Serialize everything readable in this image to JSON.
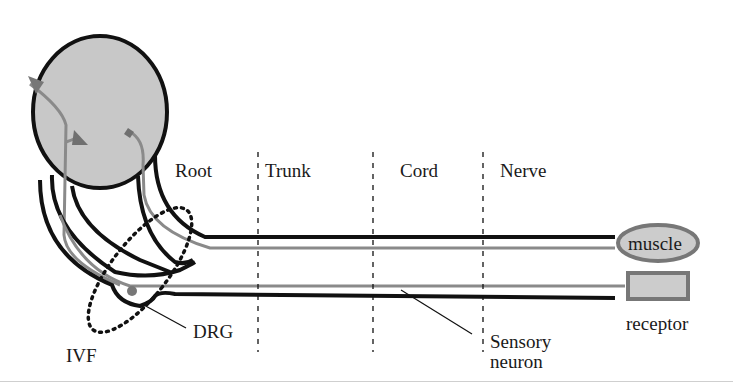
{
  "diagram": {
    "regions": [
      {
        "label": "Root"
      },
      {
        "label": "Trunk"
      },
      {
        "label": "Cord"
      },
      {
        "label": "Nerve"
      }
    ],
    "targets": {
      "muscle": "muscle",
      "receptor": "receptor"
    },
    "annotations": {
      "drg": "DRG",
      "ivf": "IVF",
      "sensory_line1": "Sensory",
      "sensory_line2": "neuron"
    },
    "colors": {
      "spinal_cord_fill": "#c8c8c8",
      "outline": "#111111",
      "neuron_gray": "#8a8a8a",
      "marker_gray": "#707070",
      "target_fill": "#cccccc"
    }
  }
}
